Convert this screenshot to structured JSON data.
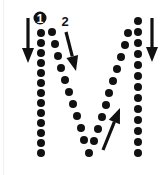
{
  "letter": "M",
  "colors": {
    "ink": "#111111",
    "background": "#ffffff",
    "edge": "#f0f0f0"
  },
  "stroke_labels": [
    {
      "label": "1",
      "style": "white-on-black-circle",
      "x": 40,
      "y": 18
    },
    {
      "label": "2",
      "style": "plain",
      "x": 65,
      "y": 21
    }
  ],
  "dot_radius": 4,
  "strokes": [
    {
      "name": "left-vertical",
      "dots": [
        [
          41,
          33
        ],
        [
          41,
          43
        ],
        [
          41,
          53
        ],
        [
          41,
          63
        ],
        [
          41,
          73
        ],
        [
          41,
          83
        ],
        [
          41,
          93
        ],
        [
          41,
          103
        ],
        [
          41,
          113
        ],
        [
          41,
          123
        ],
        [
          41,
          133
        ],
        [
          41,
          143
        ],
        [
          41,
          153
        ]
      ]
    },
    {
      "name": "down-diagonal",
      "dots": [
        [
          52,
          32
        ],
        [
          55,
          44
        ],
        [
          58,
          56
        ],
        [
          61,
          68
        ],
        [
          65,
          80
        ],
        [
          69,
          92
        ],
        [
          73,
          104
        ],
        [
          77,
          116
        ],
        [
          81,
          128
        ],
        [
          84,
          140
        ],
        [
          89,
          153
        ]
      ]
    },
    {
      "name": "up-diagonal",
      "dots": [
        [
          94,
          141
        ],
        [
          98,
          129
        ],
        [
          102,
          117
        ],
        [
          106,
          105
        ],
        [
          109,
          93
        ],
        [
          113,
          81
        ],
        [
          117,
          69
        ],
        [
          121,
          57
        ],
        [
          125,
          45
        ],
        [
          128,
          33
        ]
      ]
    },
    {
      "name": "right-vertical",
      "dots": [
        [
          138,
          21
        ],
        [
          138,
          32
        ],
        [
          138,
          43
        ],
        [
          138,
          54
        ],
        [
          138,
          65
        ],
        [
          138,
          76
        ],
        [
          138,
          87
        ],
        [
          138,
          98
        ],
        [
          138,
          109
        ],
        [
          138,
          120
        ],
        [
          138,
          131
        ],
        [
          138,
          142
        ],
        [
          138,
          153
        ]
      ]
    }
  ],
  "arrows": [
    {
      "name": "left-down-arrow",
      "x1": 28,
      "y1": 18,
      "x2": 28,
      "y2": 63
    },
    {
      "name": "diagonal-down-arrow",
      "x1": 66,
      "y1": 32,
      "x2": 76,
      "y2": 71
    },
    {
      "name": "diagonal-up-arrow",
      "x1": 103,
      "y1": 150,
      "x2": 120,
      "y2": 108
    },
    {
      "name": "right-down-arrow",
      "x1": 152,
      "y1": 18,
      "x2": 152,
      "y2": 62
    }
  ]
}
